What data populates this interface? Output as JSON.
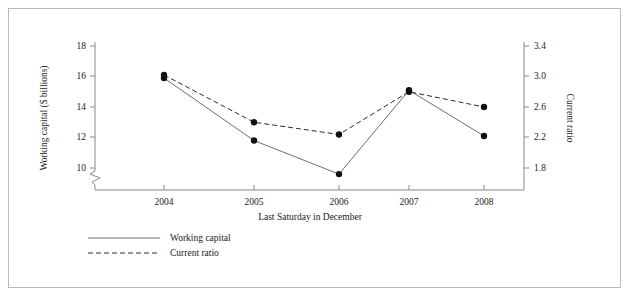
{
  "chart_data": {
    "type": "line",
    "title": "",
    "xlabel": "Last Saturday in December",
    "categories": [
      "2004",
      "2005",
      "2006",
      "2007",
      "2008"
    ],
    "x_tick_labels": [
      "2004",
      "2005",
      "2006",
      "2007",
      "2008"
    ],
    "grid": false,
    "legend_position": "bottom-left",
    "axes": {
      "left": {
        "label": "Working capital ($ billions)",
        "ticks": [
          10,
          12,
          14,
          16,
          18
        ],
        "tick_labels": [
          "10",
          "12",
          "14",
          "16",
          "18"
        ],
        "ylim": [
          9.0,
          18.0
        ],
        "broken_axis": true
      },
      "right": {
        "label": "Current ratio",
        "ticks": [
          1.8,
          2.2,
          2.6,
          3.0,
          3.4
        ],
        "tick_labels": [
          "1.8",
          "2.2",
          "2.6",
          "3.0",
          "3.4"
        ],
        "ylim": [
          1.62,
          3.4
        ]
      }
    },
    "series": [
      {
        "name": "Working capital",
        "axis": "left",
        "style": "solid",
        "values": [
          15.9,
          11.8,
          9.6,
          15.1,
          12.1
        ]
      },
      {
        "name": "Current ratio",
        "axis": "right",
        "style": "dashed",
        "values": [
          3.02,
          2.4,
          2.24,
          2.8,
          2.6
        ]
      }
    ]
  },
  "legend": {
    "items": [
      {
        "label": "Working capital",
        "style": "solid"
      },
      {
        "label": "Current ratio",
        "style": "dashed"
      }
    ]
  }
}
